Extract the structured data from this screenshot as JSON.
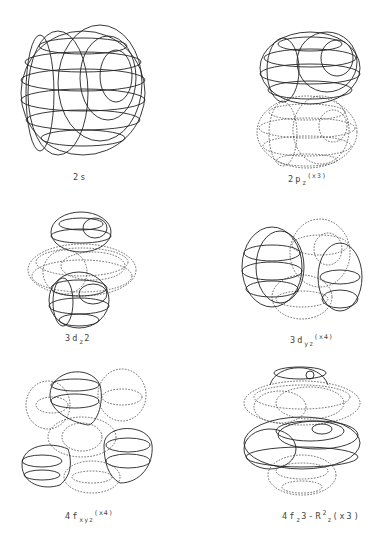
{
  "figure": {
    "panels": [
      {
        "id": "2s",
        "main": "2",
        "orb": "s",
        "sub": "",
        "mid": "",
        "sup": "",
        "sub2": "",
        "mult": ""
      },
      {
        "id": "2pz",
        "main": "2",
        "orb": "p",
        "sub": "z",
        "mid": "",
        "sup": "",
        "sub2": "",
        "mult": "(x3)"
      },
      {
        "id": "3dz2",
        "main": "3",
        "orb": "d",
        "sub": "z",
        "mid": "2",
        "sup": "",
        "sub2": "",
        "mult": ""
      },
      {
        "id": "3dyz",
        "main": "3",
        "orb": "d",
        "sub": "yz",
        "mid": "",
        "sup": "",
        "sub2": "",
        "mult": "(x4)"
      },
      {
        "id": "4fxyz",
        "main": "4",
        "orb": "f",
        "sub": "xyz",
        "mid": "",
        "sup": "",
        "sub2": "",
        "mult": "(x4)"
      },
      {
        "id": "4fz3",
        "main": "4",
        "orb": "f",
        "sub": "z",
        "mid": "3-R",
        "sup": "2",
        "sub2": "z",
        "mult": "(x3)"
      }
    ],
    "labels": {
      "2s": "2s",
      "2pz": "2pz(x3)",
      "3dz2": "3dz2",
      "3dyz": "3dyz(x4)",
      "4fxyz": "4fxyz(x4)",
      "4fz3": "4fz3-R2z(x3)"
    },
    "legend": {
      "solid_lines": "positive lobe",
      "dotted_lines": "negative lobe"
    }
  }
}
